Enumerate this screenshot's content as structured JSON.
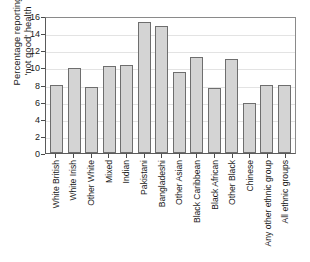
{
  "chart_data": {
    "type": "bar",
    "title": "",
    "xlabel": "",
    "ylabel": "Percentage reporting 'not good' health",
    "ylabel_line1": "Percentage reporting",
    "ylabel_line2": "'not good' health",
    "ylim": [
      0,
      16
    ],
    "ytick_values": [
      0,
      2,
      4,
      6,
      8,
      10,
      12,
      14,
      16
    ],
    "ytick_labels": [
      "0",
      "2",
      "4",
      "6",
      "8",
      "10",
      "12",
      "14",
      "16"
    ],
    "grid": true,
    "legend": "none",
    "bar_color": "#d4d4d4",
    "bar_border_color": "#6e6e6e",
    "categories": [
      "White British",
      "White Irish",
      "Other White",
      "Mixed",
      "Indian",
      "Pakistani",
      "Bangladeshi",
      "Other Asian",
      "Black Caribbean",
      "Black African",
      "Other Black",
      "Chinese",
      "Any other ethnic group",
      "All ethnic groups"
    ],
    "values": [
      8.0,
      9.9,
      7.7,
      10.2,
      10.3,
      15.3,
      14.8,
      9.5,
      11.2,
      7.6,
      11.0,
      5.8,
      8.0,
      8.0
    ]
  }
}
